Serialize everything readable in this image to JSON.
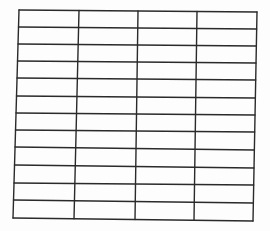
{
  "page": {
    "type": "blank-table-grid",
    "background_color": "#fdfdfd",
    "line_color": "#2a2a2a"
  },
  "table": {
    "columns": 4,
    "rows": 12,
    "top_edge": {
      "left": [
        19,
        10
      ],
      "right": [
        257,
        12
      ]
    },
    "bottom_edge": {
      "left": [
        13,
        218
      ],
      "right": [
        253,
        221
      ]
    },
    "column_x_top": [
      19,
      79,
      138,
      197,
      257
    ],
    "column_x_bottom": [
      13,
      74,
      135,
      194,
      253
    ],
    "row_y_left": [
      10,
      27,
      44,
      61,
      78,
      96,
      113,
      130,
      147,
      165,
      183,
      200,
      218
    ],
    "row_y_right": [
      12,
      29,
      46,
      63,
      80,
      98,
      115,
      132,
      150,
      168,
      185,
      203,
      221
    ],
    "cells": [
      [
        "",
        "",
        "",
        ""
      ],
      [
        "",
        "",
        "",
        ""
      ],
      [
        "",
        "",
        "",
        ""
      ],
      [
        "",
        "",
        "",
        ""
      ],
      [
        "",
        "",
        "",
        ""
      ],
      [
        "",
        "",
        "",
        ""
      ],
      [
        "",
        "",
        "",
        ""
      ],
      [
        "",
        "",
        "",
        ""
      ],
      [
        "",
        "",
        "",
        ""
      ],
      [
        "",
        "",
        "",
        ""
      ],
      [
        "",
        "",
        "",
        ""
      ],
      [
        "",
        "",
        "",
        ""
      ]
    ]
  }
}
